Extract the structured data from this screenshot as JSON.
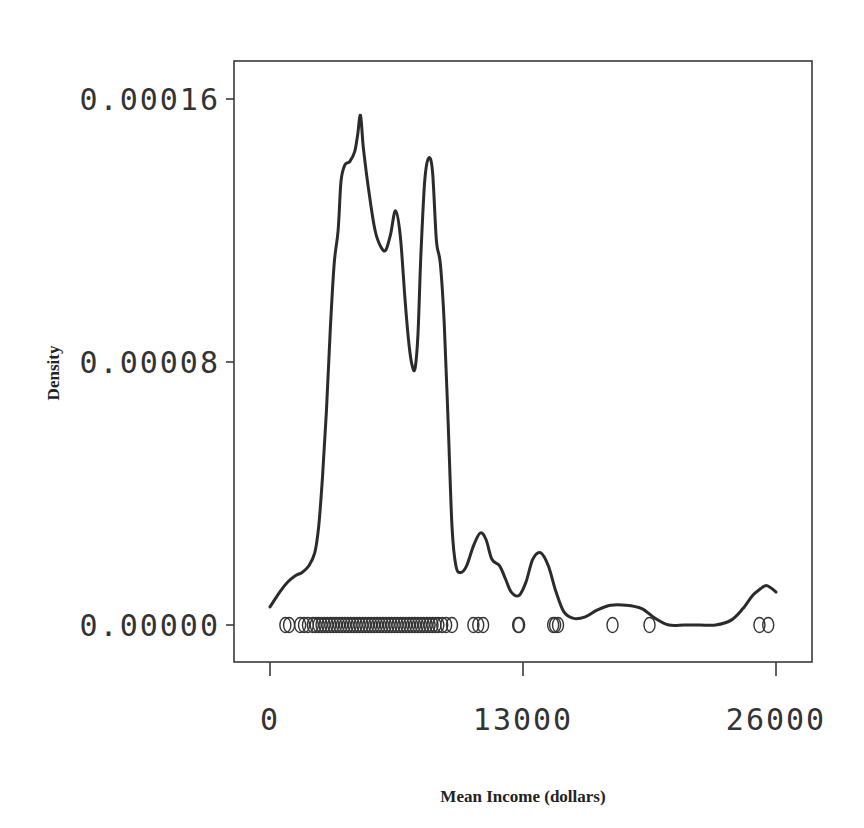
{
  "chart_data": {
    "type": "line",
    "subtype": "kernel density estimate with rug of observations",
    "title": "",
    "xlabel": "Mean Income (dollars)",
    "ylabel": "Density",
    "xlim": [
      0,
      26000
    ],
    "ylim": [
      0,
      0.00016
    ],
    "x_ticks": [
      0,
      13000,
      26000
    ],
    "x_tick_labels": [
      "0",
      "13000",
      "26000"
    ],
    "y_ticks": [
      0,
      8e-05,
      0.00016
    ],
    "y_tick_labels": [
      "0.00000",
      "0.00008",
      "0.00016"
    ],
    "grid": false,
    "legend": null,
    "series": [
      {
        "name": "density",
        "x": [
          0,
          500,
          900,
          1300,
          1650,
          2000,
          2300,
          2500,
          2700,
          2900,
          3100,
          3300,
          3500,
          3650,
          3850,
          4100,
          4350,
          4500,
          4650,
          4800,
          5100,
          5400,
          5700,
          5950,
          6200,
          6450,
          6700,
          6950,
          7150,
          7300,
          7450,
          7600,
          7750,
          7950,
          8150,
          8350,
          8550,
          8750,
          8950,
          9150,
          9350,
          9550,
          9800,
          10100,
          10450,
          10800,
          11100,
          11400,
          11800,
          12100,
          12400,
          12800,
          13150,
          13500,
          13900,
          14300,
          14700,
          15100,
          15600,
          16200,
          16800,
          17500,
          18300,
          19100,
          19800,
          20500,
          21300,
          22100,
          22900,
          23700,
          24300,
          24800,
          25200,
          25500,
          25800,
          26000
        ],
        "values": [
          5.5e-06,
          1e-05,
          1.3e-05,
          1.5e-05,
          1.6e-05,
          1.8e-05,
          2.2e-05,
          3e-05,
          4.5e-05,
          6.5e-05,
          9e-05,
          0.00011,
          0.00012,
          0.000135,
          0.00014,
          0.000141,
          0.000144,
          0.000149,
          0.000155,
          0.000145,
          0.000131,
          0.00012,
          0.000115,
          0.000114,
          0.000119,
          0.000126,
          0.000118,
          9.8e-05,
          8.5e-05,
          7.9e-05,
          7.8e-05,
          8.8e-05,
          0.000112,
          0.000135,
          0.000142,
          0.000138,
          0.000117,
          0.00011,
          9.2e-05,
          6.2e-05,
          3e-05,
          1.8e-05,
          1.6e-05,
          1.8e-05,
          2.4e-05,
          2.8e-05,
          2.6e-05,
          2e-05,
          1.8e-05,
          1.4e-05,
          1e-05,
          9e-06,
          1.3e-05,
          2e-05,
          2.2e-05,
          1.8e-05,
          1e-05,
          4e-06,
          2e-06,
          2.5e-06,
          4.5e-06,
          6e-06,
          6e-06,
          5e-06,
          2e-06,
          0.0,
          0.0,
          0.0,
          0.0,
          1.5e-06,
          5e-06,
          9e-06,
          1.1e-05,
          1.2e-05,
          1.1e-05,
          1e-05
        ]
      }
    ],
    "rug_observations_x": [
      790,
      980,
      1550,
      1750,
      1950,
      2200,
      2350,
      2500,
      2650,
      2800,
      2950,
      3100,
      3250,
      3400,
      3550,
      3700,
      3850,
      4000,
      4150,
      4300,
      4450,
      4600,
      4750,
      4900,
      5050,
      5200,
      5350,
      5500,
      5650,
      5800,
      5950,
      6100,
      6250,
      6400,
      6550,
      6700,
      6850,
      7000,
      7150,
      7300,
      7450,
      7600,
      7750,
      7900,
      8050,
      8200,
      8350,
      8500,
      8650,
      8850,
      9050,
      9350,
      10450,
      10700,
      10950,
      12750,
      12800,
      14550,
      14650,
      14800,
      17600,
      19500,
      25150,
      25600
    ]
  },
  "plot": {
    "x_axis_title": "Mean Income (dollars)",
    "y_axis_title": "Density"
  }
}
